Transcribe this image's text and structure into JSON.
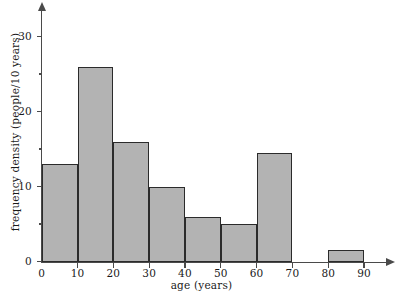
{
  "chart_data": {
    "type": "bar",
    "title": "",
    "subtitle": "",
    "xlabel": "age (years)",
    "ylabel": "frequency density (people/10 years)",
    "xlim": [
      0,
      95
    ],
    "ylim": [
      0,
      33
    ],
    "grid": false,
    "legend": null,
    "x_ticks": [
      {
        "value": 0,
        "label": "0"
      },
      {
        "value": 10,
        "label": "10"
      },
      {
        "value": 20,
        "label": "20"
      },
      {
        "value": 30,
        "label": "30"
      },
      {
        "value": 40,
        "label": "40"
      },
      {
        "value": 50,
        "label": "50"
      },
      {
        "value": 60,
        "label": "60"
      },
      {
        "value": 70,
        "label": "70"
      },
      {
        "value": 80,
        "label": "80"
      },
      {
        "value": 90,
        "label": "90"
      }
    ],
    "y_ticks_major": [
      {
        "value": 0,
        "label": "0"
      },
      {
        "value": 10,
        "label": "10"
      },
      {
        "value": 20,
        "label": "20"
      },
      {
        "value": 30,
        "label": "30"
      }
    ],
    "y_ticks_minor": [
      5,
      15,
      25
    ],
    "bin_edges": [
      0,
      10,
      20,
      30,
      40,
      50,
      60,
      70,
      80,
      90
    ],
    "categories": [
      "0-10",
      "10-20",
      "20-30",
      "30-40",
      "40-50",
      "50-60",
      "60-70",
      "70-80",
      "80-90"
    ],
    "values": [
      13,
      26,
      16,
      10,
      6,
      5,
      14.5,
      0,
      1.5
    ],
    "bar_fill_color": "#b3b3b3",
    "bar_edge_color": "#2b2b2b",
    "axis_color": "#4a4a4a"
  }
}
